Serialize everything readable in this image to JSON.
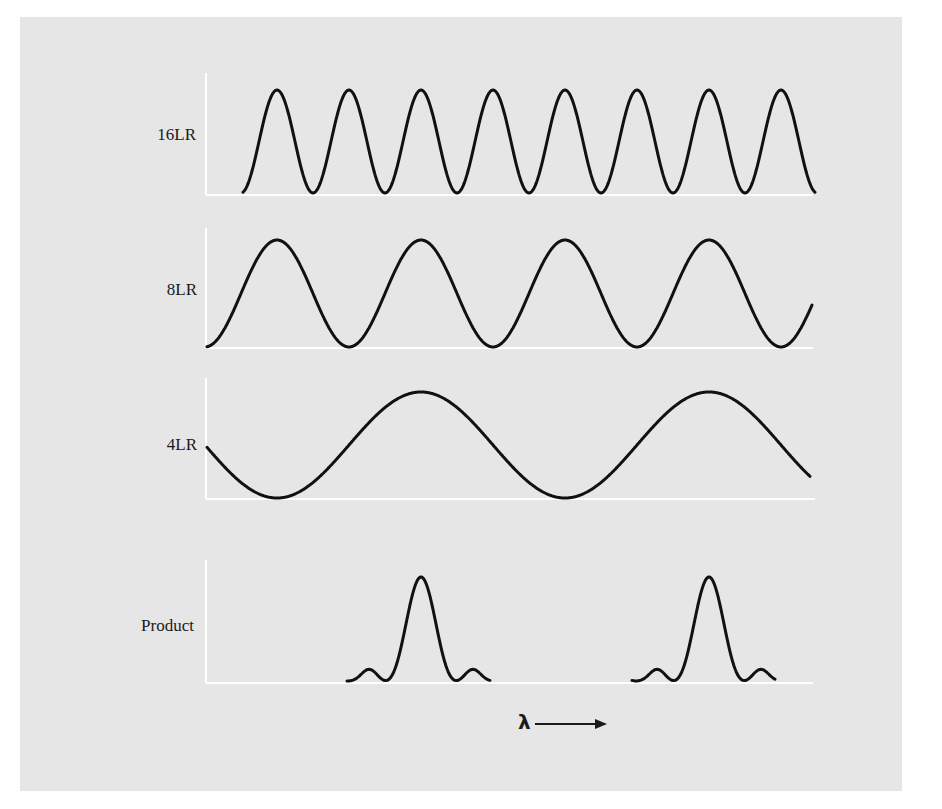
{
  "figure": {
    "background_color": "#e6e6e6",
    "page_color": "#ffffff",
    "axis_color": "#ffffff",
    "curve_color": "#111111"
  },
  "panels": [
    {
      "label": "16LR",
      "kind": "cosine",
      "period_px": 72
    },
    {
      "label": "8LR",
      "kind": "cosine",
      "period_px": 144
    },
    {
      "label": "4LR",
      "kind": "cosine",
      "period_px": 288
    },
    {
      "label": "Product",
      "kind": "product"
    }
  ],
  "x_axis": {
    "symbol": "λ",
    "arrow": "→"
  },
  "chart_data": {
    "type": "line",
    "title": "",
    "xlabel": "λ →",
    "ylabel": "",
    "grid": false,
    "series": [
      {
        "name": "16LR",
        "shape": "cos^2",
        "relative_period": 1,
        "peak_x_positions_px": [
          277,
          349,
          421,
          493,
          565,
          637,
          709,
          781
        ],
        "min": 0,
        "max": 1
      },
      {
        "name": "8LR",
        "shape": "cos^2",
        "relative_period": 2,
        "peak_x_positions_px": [
          277,
          421,
          565,
          709
        ],
        "min": 0,
        "max": 1
      },
      {
        "name": "4LR",
        "shape": "cos^2",
        "relative_period": 4,
        "peak_x_positions_px": [
          421,
          709
        ],
        "trough_x_positions_px": [
          277,
          565
        ],
        "min": 0,
        "max": 1
      },
      {
        "name": "Product",
        "shape": "product of the three",
        "peak_x_positions_px": [
          421,
          709
        ],
        "side_lobes": "small",
        "min": 0,
        "max": 1
      }
    ]
  }
}
